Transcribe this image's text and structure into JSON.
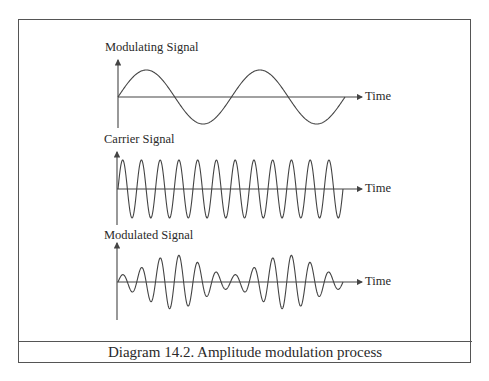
{
  "caption": "Diagram 14.2. Amplitude modulation process",
  "panels": [
    {
      "title": "Modulating Signal",
      "axis_label": "Time",
      "type": "sine",
      "cycles": 2
    },
    {
      "title": "Carrier Signal",
      "axis_label": "Time",
      "type": "carrier",
      "cycles": 12
    },
    {
      "title": "Modulated Signal",
      "axis_label": "Time",
      "type": "am",
      "carrier_cycles": 12,
      "envelope_cycles": 2
    }
  ],
  "colors": {
    "line": "#444444",
    "frame": "#555555",
    "text": "#2a2a2a"
  }
}
